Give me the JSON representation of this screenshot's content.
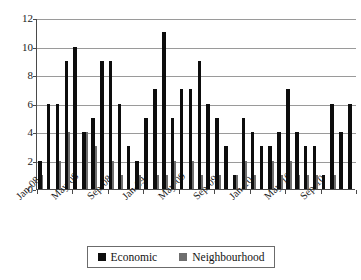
{
  "chart_data": {
    "type": "bar",
    "title": "",
    "subtitle": "",
    "xlabel": "",
    "ylabel": "",
    "ylim": [
      0,
      12
    ],
    "yticks": [
      0,
      2,
      4,
      6,
      8,
      10,
      12
    ],
    "grid": true,
    "legend_position": "bottom",
    "bar_style": "overlapping",
    "categories": [
      "Jan-08",
      "Feb-08",
      "Mar-08",
      "Apr-08",
      "May-08",
      "Jun-08",
      "Jul-08",
      "Aug-08",
      "Sep-08",
      "Oct-08",
      "Nov-08",
      "Dec-08",
      "Jan-09",
      "Feb-09",
      "Mar-09",
      "Apr-09",
      "May-09",
      "Jun-09",
      "Jul-09",
      "Aug-09",
      "Sep-09",
      "Oct-09",
      "Nov-09",
      "Dec-09",
      "Jan-10",
      "Feb-10",
      "Mar-10",
      "Apr-10",
      "May-10",
      "Jun-10",
      "Jul-10",
      "Aug-10",
      "Sep-10",
      "Oct-10",
      "Nov-10",
      "Dec-10"
    ],
    "tick_labels": [
      "Jan-08",
      "May-08",
      "Sep-08",
      "Jan-09",
      "May-09",
      "Sep-09",
      "Jan-10",
      "May-10",
      "Sep-10"
    ],
    "tick_indices": [
      0,
      4,
      8,
      12,
      16,
      20,
      24,
      28,
      32
    ],
    "series": [
      {
        "name": "Economic",
        "color": "#0d0d0d",
        "values": [
          2,
          6,
          6,
          9,
          10,
          4,
          5,
          9,
          9,
          6,
          3,
          2,
          5,
          7,
          11,
          5,
          7,
          7,
          9,
          6,
          5,
          3,
          1,
          5,
          4,
          3,
          3,
          4,
          7,
          4,
          3,
          3,
          1,
          6,
          4,
          6
        ]
      },
      {
        "name": "Neighbourhood",
        "color": "#6e6e6e",
        "values": [
          1,
          0,
          2,
          4,
          0,
          4,
          3,
          0,
          2,
          1,
          0,
          1,
          0,
          1,
          1,
          2,
          0,
          2,
          1,
          0,
          1,
          0,
          1,
          2,
          1,
          0,
          2,
          1,
          2,
          1,
          1,
          1,
          0,
          1,
          0,
          0
        ]
      }
    ]
  },
  "legend": {
    "items": [
      {
        "label": "Economic",
        "swatch": "black-square-swatch"
      },
      {
        "label": "Neighbourhood",
        "swatch": "gray-square-swatch"
      }
    ]
  }
}
